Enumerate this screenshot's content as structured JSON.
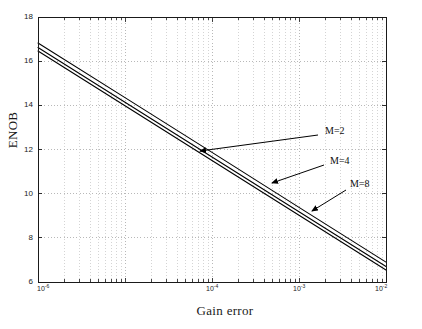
{
  "chart_data": {
    "type": "line",
    "title": "",
    "xlabel": "Gain error",
    "ylabel": "ENOB",
    "xscale": "log",
    "yscale": "linear",
    "xlim": [
      1e-06,
      0.01
    ],
    "ylim": [
      6,
      18
    ],
    "grid": true,
    "grid_style": "dotted",
    "legend": "none",
    "xtick_labels": [
      "10⁻⁶",
      "10⁻⁴",
      "10⁻³",
      "10⁻²"
    ],
    "xtick_mantissa": [
      "10",
      "10",
      "10",
      "10"
    ],
    "xtick_exponents": [
      "-6",
      "-4",
      "-3",
      "-2"
    ],
    "xtick_values": [
      1e-06,
      0.0001,
      0.001,
      0.01
    ],
    "ytick_labels": [
      "18",
      "16",
      "14",
      "12",
      "10",
      "8",
      "6"
    ],
    "ytick_values": [
      18,
      16,
      14,
      12,
      10,
      8,
      6
    ],
    "x": [
      1e-06,
      1e-05,
      0.0001,
      0.001,
      0.01
    ],
    "series": [
      {
        "name": "M=2",
        "label": "M=2",
        "values": [
          16.82,
          14.35,
          11.87,
          9.38,
          6.9
        ],
        "color": "#000000"
      },
      {
        "name": "M=4",
        "label": "M=4",
        "values": [
          16.62,
          14.14,
          11.66,
          9.18,
          6.7
        ],
        "color": "#000000"
      },
      {
        "name": "M=8",
        "label": "M=8",
        "values": [
          16.46,
          13.98,
          11.5,
          9.02,
          6.54
        ],
        "color": "#000000"
      }
    ],
    "annotations": [
      {
        "text": "M=2",
        "label_x": 325,
        "label_y": 131,
        "arrow_tail_x": 318,
        "arrow_tail_y": 135,
        "arrow_head_x": 200,
        "arrow_head_y": 151
      },
      {
        "text": "M=4",
        "label_x": 330,
        "label_y": 161,
        "arrow_tail_x": 324,
        "arrow_tail_y": 165,
        "arrow_head_x": 272,
        "arrow_head_y": 183
      },
      {
        "text": "M=8",
        "label_x": 350,
        "label_y": 184,
        "arrow_tail_x": 346,
        "arrow_tail_y": 190,
        "arrow_head_x": 312,
        "arrow_head_y": 211
      }
    ],
    "colors": {
      "axis": "#1a1a1a",
      "grid": "#b8b8b8",
      "line": "#000000",
      "background": "#ffffff",
      "text": "#1a1a1a"
    }
  },
  "figure": {
    "plot_left": 38,
    "plot_right": 386,
    "plot_top": 17,
    "plot_bottom": 282
  }
}
